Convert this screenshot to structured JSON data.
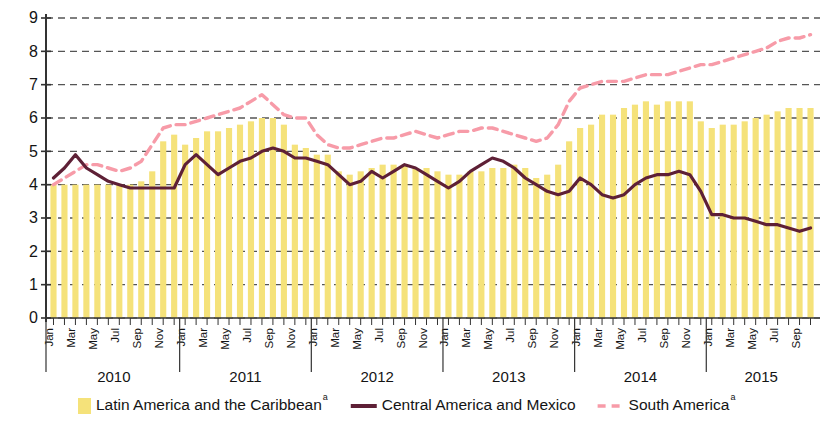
{
  "chart_data": {
    "type": "bar",
    "title": "",
    "subtitle": "",
    "xlabel": "",
    "ylabel": "",
    "ylim": [
      0,
      9
    ],
    "ytick_labels": [
      "0",
      "1",
      "2",
      "3",
      "4",
      "5",
      "6",
      "7",
      "8",
      "9"
    ],
    "yticks": [
      0,
      1,
      2,
      3,
      4,
      5,
      6,
      7,
      8,
      9
    ],
    "grid": true,
    "grid_style": "dashed",
    "legend_position": "bottom",
    "years": [
      "2010",
      "2011",
      "2012",
      "2013",
      "2014",
      "2015"
    ],
    "month_tick_labels": [
      "Jan",
      "Mar",
      "May",
      "Jul",
      "Sep",
      "Nov"
    ],
    "x": [
      "Jan 2010",
      "Feb 2010",
      "Mar 2010",
      "Apr 2010",
      "May 2010",
      "Jun 2010",
      "Jul 2010",
      "Aug 2010",
      "Sep 2010",
      "Oct 2010",
      "Nov 2010",
      "Dec 2010",
      "Jan 2011",
      "Feb 2011",
      "Mar 2011",
      "Apr 2011",
      "May 2011",
      "Jun 2011",
      "Jul 2011",
      "Aug 2011",
      "Sep 2011",
      "Oct 2011",
      "Nov 2011",
      "Dec 2011",
      "Jan 2012",
      "Feb 2012",
      "Mar 2012",
      "Apr 2012",
      "May 2012",
      "Jun 2012",
      "Jul 2012",
      "Aug 2012",
      "Sep 2012",
      "Oct 2012",
      "Nov 2012",
      "Dec 2012",
      "Jan 2013",
      "Feb 2013",
      "Mar 2013",
      "Apr 2013",
      "May 2013",
      "Jun 2013",
      "Jul 2013",
      "Aug 2013",
      "Sep 2013",
      "Oct 2013",
      "Nov 2013",
      "Dec 2013",
      "Jan 2014",
      "Feb 2014",
      "Mar 2014",
      "Apr 2014",
      "May 2014",
      "Jun 2014",
      "Jul 2014",
      "Aug 2014",
      "Sep 2014",
      "Oct 2014",
      "Nov 2014",
      "Dec 2014",
      "Jan 2015",
      "Feb 2015",
      "Mar 2015",
      "Apr 2015",
      "May 2015",
      "Jun 2015",
      "Jul 2015",
      "Aug 2015",
      "Sep 2015",
      "Oct 2015"
    ],
    "series": [
      {
        "name": "Latin America and the Caribbean",
        "note": "a",
        "type": "bar",
        "color": "#F5E27A",
        "values": [
          4.0,
          4.0,
          4.0,
          4.0,
          4.0,
          4.0,
          4.0,
          4.0,
          4.1,
          4.4,
          5.3,
          5.5,
          5.2,
          5.4,
          5.6,
          5.6,
          5.7,
          5.8,
          5.9,
          6.0,
          6.0,
          5.8,
          5.2,
          5.1,
          4.9,
          4.9,
          4.4,
          4.3,
          4.4,
          4.5,
          4.6,
          4.6,
          4.6,
          4.5,
          4.5,
          4.4,
          4.3,
          4.3,
          4.4,
          4.4,
          4.5,
          4.5,
          4.6,
          4.5,
          4.2,
          4.3,
          4.6,
          5.3,
          5.7,
          5.8,
          6.1,
          6.1,
          6.3,
          6.4,
          6.5,
          6.4,
          6.5,
          6.5,
          6.5,
          5.9,
          5.7,
          5.8,
          5.8,
          5.9,
          6.0,
          6.1,
          6.2,
          6.3,
          6.3,
          6.3
        ]
      },
      {
        "name": "Central America and Mexico",
        "note": "",
        "type": "line",
        "color": "#5E2036",
        "line_style": "solid",
        "values": [
          4.2,
          4.5,
          4.9,
          4.5,
          4.3,
          4.1,
          4.0,
          3.9,
          3.9,
          3.9,
          3.9,
          3.9,
          4.6,
          4.9,
          4.6,
          4.3,
          4.5,
          4.7,
          4.8,
          5.0,
          5.1,
          5.0,
          4.8,
          4.8,
          4.7,
          4.6,
          4.3,
          4.0,
          4.1,
          4.4,
          4.2,
          4.4,
          4.6,
          4.5,
          4.3,
          4.1,
          3.9,
          4.1,
          4.4,
          4.6,
          4.8,
          4.7,
          4.5,
          4.2,
          4.0,
          3.8,
          3.7,
          3.8,
          4.2,
          4.0,
          3.7,
          3.6,
          3.7,
          4.0,
          4.2,
          4.3,
          4.3,
          4.4,
          4.3,
          3.8,
          3.1,
          3.1,
          3.0,
          3.0,
          2.9,
          2.8,
          2.8,
          2.7,
          2.6,
          2.7
        ]
      },
      {
        "name": "South America",
        "note": "a",
        "type": "line",
        "color": "#F79BA8",
        "line_style": "dashed",
        "values": [
          4.0,
          4.2,
          4.4,
          4.6,
          4.6,
          4.5,
          4.4,
          4.5,
          4.7,
          5.2,
          5.7,
          5.8,
          5.8,
          5.9,
          6.0,
          6.1,
          6.2,
          6.3,
          6.5,
          6.7,
          6.4,
          6.1,
          6.0,
          6.0,
          5.5,
          5.2,
          5.1,
          5.1,
          5.2,
          5.3,
          5.4,
          5.4,
          5.5,
          5.6,
          5.5,
          5.4,
          5.5,
          5.6,
          5.6,
          5.7,
          5.7,
          5.6,
          5.5,
          5.4,
          5.3,
          5.4,
          5.8,
          6.5,
          6.9,
          7.0,
          7.1,
          7.1,
          7.1,
          7.2,
          7.3,
          7.3,
          7.3,
          7.4,
          7.5,
          7.6,
          7.6,
          7.7,
          7.8,
          7.9,
          8.0,
          8.1,
          8.3,
          8.4,
          8.4,
          8.5
        ]
      }
    ]
  },
  "legend": {
    "items": [
      {
        "label": "Latin America and the Caribbean",
        "sup": "a",
        "marker": "swatch",
        "color": "#F5E27A"
      },
      {
        "label": "Central America and Mexico",
        "sup": "",
        "marker": "solid-line",
        "color": "#5E2036"
      },
      {
        "label": "South America",
        "sup": "a",
        "marker": "dashed-line",
        "color": "#F79BA8"
      }
    ]
  },
  "colors": {
    "bar": "#F5E27A",
    "central_america_line": "#5E2036",
    "south_america_line": "#F79BA8",
    "axis": "#333333",
    "grid": "#555555",
    "background": "#FFFFFF"
  }
}
